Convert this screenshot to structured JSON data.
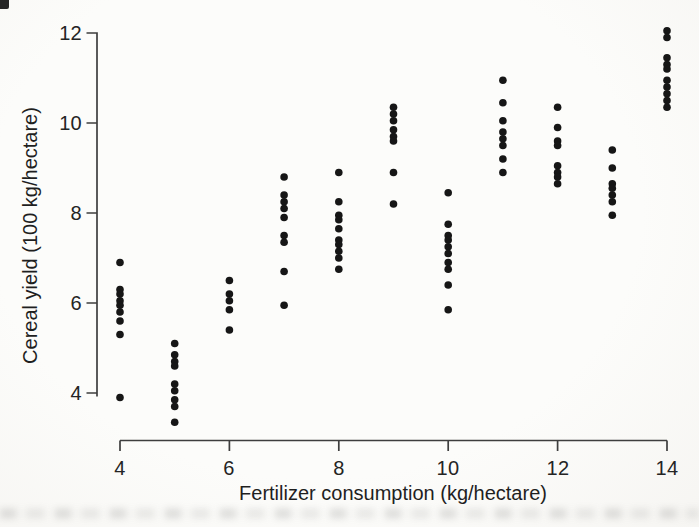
{
  "figure": {
    "background_color": "#fcfcfa",
    "axis_color": "#3e3e3e",
    "text_color": "#242424"
  },
  "chart_data": {
    "type": "scatter",
    "title": "",
    "xlabel": "Fertilizer consumption (kg/hectare)",
    "ylabel": "Cereal yield (100 kg/hectare)",
    "x_ticks": [
      4,
      6,
      8,
      10,
      12,
      14
    ],
    "y_ticks": [
      12,
      10,
      8,
      6,
      4
    ],
    "xlim": [
      4,
      14
    ],
    "ylim": [
      3.2,
      12.2
    ],
    "grid": false,
    "legend": "none",
    "marker": {
      "shape": "circle",
      "color": "#161616",
      "radius_px": 3.8
    },
    "points": [
      [
        4,
        6.9
      ],
      [
        4,
        6.3
      ],
      [
        4,
        6.2
      ],
      [
        4,
        6.05
      ],
      [
        4,
        5.95
      ],
      [
        4,
        5.8
      ],
      [
        4,
        5.6
      ],
      [
        4,
        5.3
      ],
      [
        4,
        3.9
      ],
      [
        5,
        5.1
      ],
      [
        5,
        4.85
      ],
      [
        5,
        4.7
      ],
      [
        5,
        4.6
      ],
      [
        5,
        4.2
      ],
      [
        5,
        4.05
      ],
      [
        5,
        3.85
      ],
      [
        5,
        3.7
      ],
      [
        5,
        3.35
      ],
      [
        6,
        6.5
      ],
      [
        6,
        6.2
      ],
      [
        6,
        6.05
      ],
      [
        6,
        5.85
      ],
      [
        6,
        5.4
      ],
      [
        7,
        8.8
      ],
      [
        7,
        8.4
      ],
      [
        7,
        8.25
      ],
      [
        7,
        8.1
      ],
      [
        7,
        7.9
      ],
      [
        7,
        7.5
      ],
      [
        7,
        7.35
      ],
      [
        7,
        6.7
      ],
      [
        7,
        5.95
      ],
      [
        8,
        8.9
      ],
      [
        8,
        8.25
      ],
      [
        8,
        7.95
      ],
      [
        8,
        7.85
      ],
      [
        8,
        7.65
      ],
      [
        8,
        7.4
      ],
      [
        8,
        7.3
      ],
      [
        8,
        7.15
      ],
      [
        8,
        7.0
      ],
      [
        8,
        6.75
      ],
      [
        9,
        10.35
      ],
      [
        9,
        10.2
      ],
      [
        9,
        10.05
      ],
      [
        9,
        9.85
      ],
      [
        9,
        9.7
      ],
      [
        9,
        9.6
      ],
      [
        9,
        8.9
      ],
      [
        9,
        8.2
      ],
      [
        10,
        8.45
      ],
      [
        10,
        7.75
      ],
      [
        10,
        7.5
      ],
      [
        10,
        7.4
      ],
      [
        10,
        7.25
      ],
      [
        10,
        7.1
      ],
      [
        10,
        6.9
      ],
      [
        10,
        6.75
      ],
      [
        10,
        6.4
      ],
      [
        10,
        5.85
      ],
      [
        11,
        10.95
      ],
      [
        11,
        10.45
      ],
      [
        11,
        10.05
      ],
      [
        11,
        9.8
      ],
      [
        11,
        9.65
      ],
      [
        11,
        9.5
      ],
      [
        11,
        9.2
      ],
      [
        11,
        8.9
      ],
      [
        12,
        10.35
      ],
      [
        12,
        9.9
      ],
      [
        12,
        9.6
      ],
      [
        12,
        9.5
      ],
      [
        12,
        9.05
      ],
      [
        12,
        8.9
      ],
      [
        12,
        8.8
      ],
      [
        12,
        8.65
      ],
      [
        13,
        9.4
      ],
      [
        13,
        9.0
      ],
      [
        13,
        8.65
      ],
      [
        13,
        8.55
      ],
      [
        13,
        8.4
      ],
      [
        13,
        8.25
      ],
      [
        13,
        7.95
      ],
      [
        14,
        12.05
      ],
      [
        14,
        11.9
      ],
      [
        14,
        11.45
      ],
      [
        14,
        11.3
      ],
      [
        14,
        11.2
      ],
      [
        14,
        10.95
      ],
      [
        14,
        10.8
      ],
      [
        14,
        10.65
      ],
      [
        14,
        10.5
      ],
      [
        14,
        10.35
      ]
    ]
  }
}
